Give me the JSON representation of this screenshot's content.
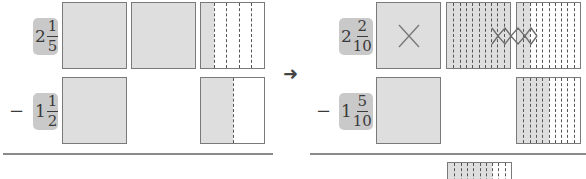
{
  "left": {
    "minuend": {
      "whole": "2",
      "numerator": "1",
      "denominator": "5"
    },
    "subtrahend_sign": "−",
    "subtrahend": {
      "whole": "1",
      "numerator": "1",
      "denominator": "2"
    },
    "minuend_models": [
      {
        "parts": 1,
        "shaded": 1
      },
      {
        "parts": 1,
        "shaded": 1
      },
      {
        "parts": 5,
        "shaded": 1
      }
    ],
    "subtrahend_models": [
      {
        "parts": 1,
        "shaded": 1
      },
      {
        "parts": 2,
        "shaded": 1
      }
    ]
  },
  "arrow": "➜",
  "right": {
    "minuend": {
      "whole": "2",
      "numerator": "2",
      "denominator": "10"
    },
    "subtrahend_sign": "−",
    "subtrahend": {
      "whole": "1",
      "numerator": "5",
      "denominator": "10"
    },
    "minuend_models": [
      {
        "parts": 1,
        "shaded": 1,
        "crossed_out": true
      },
      {
        "parts": 10,
        "shaded": 10,
        "crossed_columns": 3
      },
      {
        "parts": 10,
        "shaded": 2,
        "crossed_columns": 2
      }
    ],
    "subtrahend_models": [
      {
        "parts": 1,
        "shaded": 1
      },
      {
        "parts": 10,
        "shaded": 5
      }
    ],
    "result_model": {
      "parts": 10,
      "shaded": 7
    }
  },
  "colors": {
    "shade": "#dedede",
    "badge": "#c9c9c9",
    "border": "#7a7a7a",
    "rule": "#8a8a8a"
  }
}
